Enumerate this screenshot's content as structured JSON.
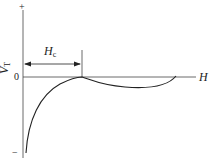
{
  "diagram": {
    "type": "curve-plot",
    "y_axis": {
      "label": "V",
      "label_sub": "T",
      "plus": "+",
      "minus": "−",
      "zero": "0"
    },
    "x_axis": {
      "label": "H"
    },
    "dimension": {
      "label": "H",
      "label_sub": "c"
    },
    "colors": {
      "line": "#222222",
      "axis": "#444444"
    }
  }
}
